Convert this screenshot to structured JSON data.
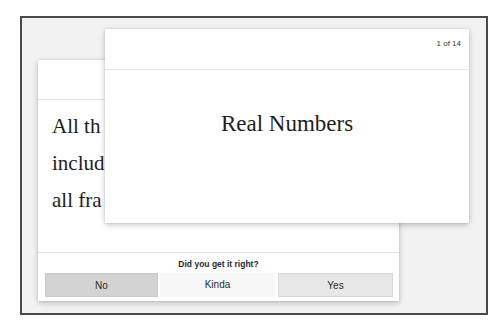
{
  "flashcards": {
    "progress": {
      "current": 1,
      "total": 14,
      "label": "1 of 14"
    },
    "front_card": {
      "question": "Real Numbers"
    },
    "back_card": {
      "answer_lines_visible": [
        "All th",
        "includ",
        "all fra"
      ]
    },
    "feedback": {
      "prompt": "Did you get it right?",
      "buttons": [
        {
          "id": "no",
          "label": "No",
          "color": "#d3d3d3"
        },
        {
          "id": "kinda",
          "label": "Kinda",
          "color": "#f7f7f7"
        },
        {
          "id": "yes",
          "label": "Yes",
          "color": "#e7e7e7"
        }
      ]
    }
  },
  "colors": {
    "frame_border": "#4a4a4a",
    "frame_background": "#f2f2f2",
    "card_background": "#ffffff",
    "text": "#1e1e1e"
  }
}
